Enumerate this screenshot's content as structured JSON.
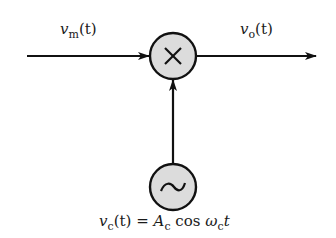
{
  "diagram": {
    "type": "mixer block diagram",
    "input_signal": {
      "symbol": "v",
      "subscript": "m",
      "arg": "(t)"
    },
    "output_signal": {
      "symbol": "v",
      "subscript": "o",
      "arg": "(t)"
    },
    "multiplier_symbol": "×",
    "oscillator_symbol": "~",
    "carrier": {
      "symbol": "v",
      "subscript": "c",
      "arg": "(t)",
      "equals": "=",
      "amp": "A",
      "amp_sub": "c",
      "func": "cos",
      "omega": "ω",
      "omega_sub": "c",
      "t": "t"
    },
    "colors": {
      "stroke": "#111111",
      "fill": "#dcdcdc"
    }
  }
}
